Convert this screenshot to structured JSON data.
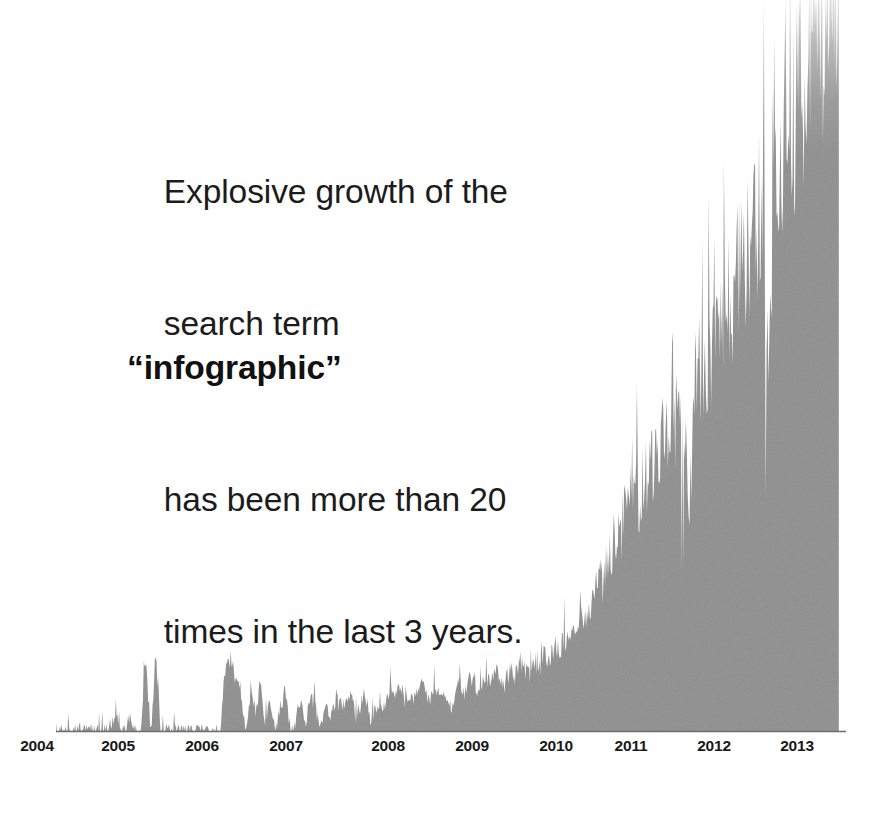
{
  "callout": {
    "line1": "Explosive growth of the",
    "line2_pre": "search term ",
    "line2_keyword": "“infographic”",
    "line3": "has been more than 20",
    "line4": "times in the last 3 years.",
    "full_text": "Explosive growth of the search term “infographic” has been more than 20 times in the last 3 years."
  },
  "colors": {
    "area_fill": "#979797",
    "area_fill_light": "#d8d8d8",
    "axis_line": "#6e6e6e",
    "text": "#1c1c1c",
    "axis_label": "#191919",
    "background": "#ffffff"
  },
  "axis": {
    "labels": [
      "2004",
      "2005",
      "2006",
      "2007",
      "2008",
      "2009",
      "2010",
      "2011",
      "2012",
      "2013"
    ],
    "label_x": [
      37,
      118,
      202,
      286,
      388,
      472,
      556,
      631,
      714,
      797
    ],
    "baseline_y": 731,
    "axis_left_x": 56,
    "axis_right_x": 846
  },
  "chart_data": {
    "type": "area",
    "title": "Explosive growth of the search term “infographic” has been more than 20 times in the last 3 years.",
    "subtitle": "",
    "xlabel": "",
    "ylabel": "Relative search interest",
    "grid": false,
    "legend": false,
    "legend_position": "none",
    "series_name": "infographic",
    "xlim": [
      2004.0,
      2013.9
    ],
    "ylim": [
      0,
      100
    ],
    "tick_labels": [
      "2004",
      "2005",
      "2006",
      "2007",
      "2008",
      "2009",
      "2010",
      "2011",
      "2012",
      "2013"
    ],
    "tick_values": [
      2004,
      2005,
      2006,
      2007,
      2008,
      2009,
      2010,
      2011,
      2012,
      2013
    ],
    "note": "Weekly Google Trends style series. x values are fractional years; y values are relative search interest 0-100.",
    "x": [
      2004.0,
      2004.06,
      2004.12,
      2004.19,
      2004.25,
      2004.31,
      2004.37,
      2004.44,
      2004.5,
      2004.56,
      2004.62,
      2004.69,
      2004.75,
      2004.81,
      2004.87,
      2004.94,
      2005.0,
      2005.06,
      2005.12,
      2005.19,
      2005.25,
      2005.31,
      2005.37,
      2005.44,
      2005.5,
      2005.56,
      2005.62,
      2005.69,
      2005.75,
      2005.81,
      2005.87,
      2005.94,
      2006.0,
      2006.06,
      2006.12,
      2006.19,
      2006.25,
      2006.31,
      2006.37,
      2006.44,
      2006.5,
      2006.56,
      2006.62,
      2006.69,
      2006.75,
      2006.81,
      2006.87,
      2006.94,
      2007.0,
      2007.06,
      2007.12,
      2007.19,
      2007.25,
      2007.31,
      2007.37,
      2007.44,
      2007.5,
      2007.56,
      2007.62,
      2007.69,
      2007.75,
      2007.81,
      2007.87,
      2007.94,
      2008.0,
      2008.06,
      2008.12,
      2008.19,
      2008.25,
      2008.31,
      2008.37,
      2008.44,
      2008.5,
      2008.56,
      2008.62,
      2008.69,
      2008.75,
      2008.81,
      2008.87,
      2008.94,
      2009.0,
      2009.06,
      2009.12,
      2009.19,
      2009.25,
      2009.31,
      2009.37,
      2009.44,
      2009.5,
      2009.56,
      2009.62,
      2009.69,
      2009.75,
      2009.81,
      2009.87,
      2009.94,
      2010.0,
      2010.06,
      2010.12,
      2010.19,
      2010.25,
      2010.31,
      2010.37,
      2010.44,
      2010.5,
      2010.56,
      2010.62,
      2010.69,
      2010.75,
      2010.81,
      2010.87,
      2010.94,
      2011.0,
      2011.06,
      2011.12,
      2011.19,
      2011.25,
      2011.31,
      2011.37,
      2011.44,
      2011.5,
      2011.56,
      2011.62,
      2011.69,
      2011.75,
      2011.81,
      2011.87,
      2011.94,
      2012.0,
      2012.06,
      2012.12,
      2012.19,
      2012.25,
      2012.31,
      2012.37,
      2012.44,
      2012.5,
      2012.56,
      2012.62,
      2012.69,
      2012.75,
      2012.81,
      2012.87,
      2012.94,
      2013.0,
      2013.06,
      2013.12,
      2013.19,
      2013.25,
      2013.31,
      2013.37,
      2013.44,
      2013.5,
      2013.56,
      2013.62,
      2013.69,
      2013.75,
      2013.81
    ],
    "y": [
      0,
      0,
      0,
      0,
      0,
      0,
      0,
      0,
      0,
      0,
      0,
      0,
      3,
      0,
      0,
      1,
      0,
      0,
      9,
      0,
      10,
      0,
      0,
      0,
      0,
      0,
      0,
      0,
      0,
      0,
      0,
      0,
      0,
      0,
      8,
      9,
      7,
      6,
      0,
      5,
      2,
      6,
      1,
      4,
      0,
      3,
      5,
      0,
      1,
      4,
      0,
      5,
      3,
      0,
      4,
      2,
      4,
      3,
      4,
      5,
      2,
      3,
      5,
      1,
      3,
      4,
      3,
      5,
      4,
      6,
      4,
      5,
      4,
      6,
      5,
      4,
      6,
      5,
      4,
      3,
      5,
      6,
      5,
      7,
      6,
      5,
      7,
      6,
      8,
      7,
      6,
      8,
      7,
      9,
      8,
      7,
      9,
      8,
      10,
      9,
      11,
      10,
      12,
      11,
      14,
      13,
      16,
      15,
      18,
      20,
      19,
      22,
      26,
      24,
      28,
      27,
      31,
      30,
      34,
      33,
      36,
      35,
      38,
      37,
      40,
      39,
      42,
      30,
      44,
      46,
      45,
      50,
      48,
      53,
      52,
      57,
      56,
      60,
      59,
      64,
      63,
      68,
      66,
      45,
      72,
      76,
      75,
      80,
      79,
      84,
      83,
      88,
      87,
      92,
      90,
      96,
      95,
      100
    ],
    "annotations": [
      {
        "text": "Explosive growth of the search term “infographic” has been more than 20 times in the last 3 years.",
        "x": 2004.5,
        "y": 85
      }
    ]
  }
}
